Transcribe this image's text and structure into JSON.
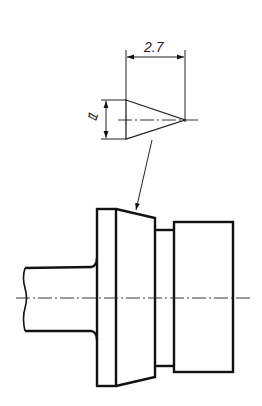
{
  "drawing": {
    "title": "Turned part with conical point detail",
    "dimensions": {
      "length_label": "2.7",
      "height_label": "1"
    },
    "colors": {
      "line": "#111111",
      "background": "#ffffff"
    }
  }
}
